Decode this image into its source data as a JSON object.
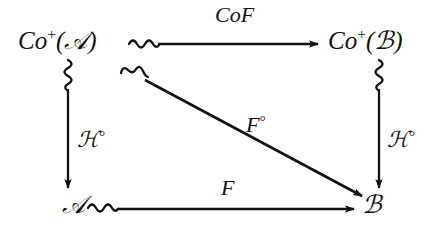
{
  "figure": {
    "kind": "commutative-diagram",
    "background_color": "#ffffff",
    "ink_color": "#121212",
    "nodes": {
      "top_left": "Co⁺(𝒜)",
      "top_right": "Co⁺(ℬ)",
      "bottom_left": "𝒜",
      "bottom_right": "ℬ"
    },
    "arrows": {
      "top": {
        "label": "CoF",
        "from": "Co⁺(𝒜)",
        "to": "Co⁺(ℬ)",
        "direction": "left-to-right",
        "tail_style": "squiggle",
        "head_style": "solid-triangle"
      },
      "bottom": {
        "label": "F",
        "from": "𝒜",
        "to": "ℬ",
        "direction": "left-to-right",
        "tail_style": "squiggle",
        "head_style": "solid-triangle"
      },
      "left": {
        "label": "ℋ°",
        "from": "Co⁺(𝒜)",
        "to": "𝒜",
        "direction": "top-to-bottom",
        "tail_style": "squiggle",
        "head_style": "solid-triangle"
      },
      "right": {
        "label": "ℋ°",
        "from": "Co⁺(ℬ)",
        "to": "ℬ",
        "direction": "top-to-bottom",
        "tail_style": "squiggle",
        "head_style": "solid-triangle"
      },
      "diagonal": {
        "label": "F°",
        "from": "Co⁺(𝒜)",
        "to": "ℬ",
        "direction": "top-left-to-bottom-right",
        "tail_style": "squiggle",
        "head_style": "solid-triangle"
      }
    },
    "node_parts": {
      "top_left": {
        "prefix": "Co",
        "superscript": "+",
        "open": "(",
        "object": "𝒜",
        "close": ")"
      },
      "top_right": {
        "prefix": "Co",
        "superscript": "+",
        "open": "(",
        "object": "ℬ",
        "close": ")"
      }
    },
    "label_parts": {
      "h_circ": {
        "base": "ℋ",
        "degree": "°"
      },
      "f_circ": {
        "base": "F",
        "degree": "°"
      },
      "cof": "CoF",
      "f": "F"
    }
  }
}
